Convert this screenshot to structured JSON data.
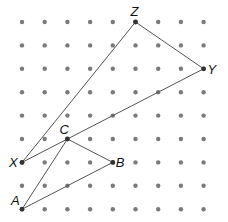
{
  "diagram": {
    "type": "dot-grid-geometry",
    "grid": {
      "columns": 9,
      "rows": 9,
      "origin_x": 22,
      "origin_y": 22,
      "spacing_x": 22.7,
      "spacing_y": 23.4,
      "dot_color": "#7a7a7a",
      "dot_radius": 2.2
    },
    "points": [
      {
        "label": "Z",
        "col": 5,
        "row": 0,
        "label_dx": -5,
        "label_dy": -6
      },
      {
        "label": "Y",
        "col": 8,
        "row": 2,
        "label_dx": 4,
        "label_dy": 5
      },
      {
        "label": "X",
        "col": 0,
        "row": 6,
        "label_dx": -13,
        "label_dy": 5
      },
      {
        "label": "C",
        "col": 2,
        "row": 5,
        "label_dx": -8,
        "label_dy": -5
      },
      {
        "label": "B",
        "col": 4,
        "row": 6,
        "label_dx": 3,
        "label_dy": 5
      },
      {
        "label": "A",
        "col": 0,
        "row": 8,
        "label_dx": -11,
        "label_dy": -4
      }
    ],
    "triangles": [
      {
        "name": "XYZ",
        "vertices": [
          "X",
          "Y",
          "Z"
        ]
      },
      {
        "name": "ABC",
        "vertices": [
          "A",
          "B",
          "C"
        ]
      }
    ],
    "line_color": "#555555",
    "point_color": "#333333"
  }
}
